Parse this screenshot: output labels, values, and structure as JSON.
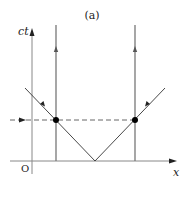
{
  "figure": {
    "panel_label": "(a)",
    "axes": {
      "vertical_label": "ct",
      "horizontal_label": "x",
      "origin_label": "O"
    },
    "elements": {
      "worldlines": [
        "left vertical worldline with upward arrow",
        "right vertical worldline with upward arrow"
      ],
      "light_rays": [
        "left ray going up-left",
        "right ray going up-right"
      ],
      "events": [
        "left intersection dot",
        "right intersection dot"
      ],
      "simultaneity_line": "dashed horizontal line with arrow marker"
    },
    "colors": {
      "axis": "#666666",
      "worldline": "#777777",
      "ray": "#333333",
      "dot": "#000000"
    }
  }
}
